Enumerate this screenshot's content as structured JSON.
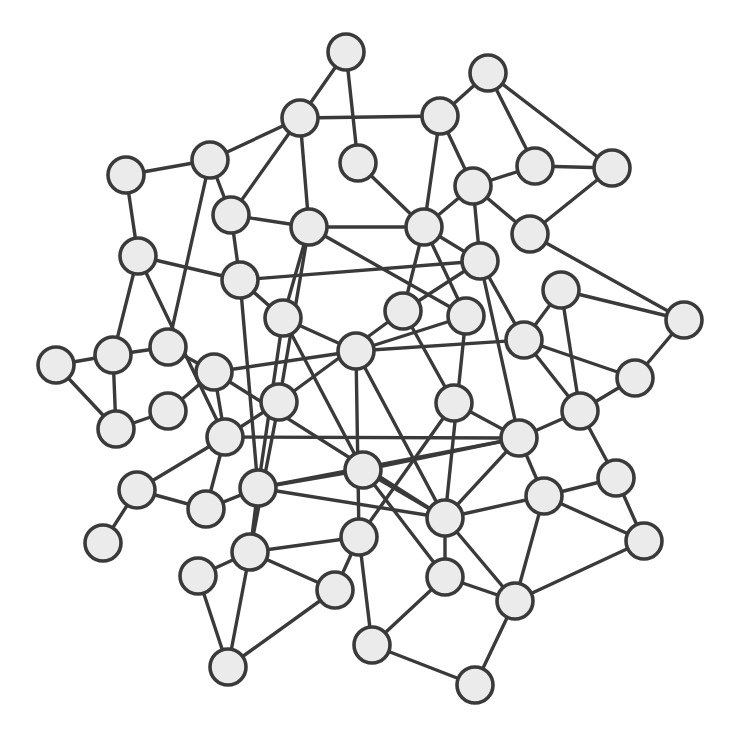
{
  "diagram": {
    "type": "network-graph",
    "style": {
      "background": "#ffffff",
      "node_fill": "#ebebeb",
      "node_stroke": "#3a3a3a",
      "edge_color": "#3a3a3a",
      "node_radius": 18
    },
    "nodes": [
      {
        "id": 0,
        "x": 346,
        "y": 52
      },
      {
        "id": 1,
        "x": 300,
        "y": 118
      },
      {
        "id": 2,
        "x": 488,
        "y": 73
      },
      {
        "id": 3,
        "x": 440,
        "y": 116
      },
      {
        "id": 4,
        "x": 210,
        "y": 160
      },
      {
        "id": 5,
        "x": 126,
        "y": 175
      },
      {
        "id": 6,
        "x": 358,
        "y": 163
      },
      {
        "id": 7,
        "x": 535,
        "y": 166
      },
      {
        "id": 8,
        "x": 612,
        "y": 168
      },
      {
        "id": 9,
        "x": 473,
        "y": 186
      },
      {
        "id": 10,
        "x": 231,
        "y": 215
      },
      {
        "id": 11,
        "x": 309,
        "y": 227
      },
      {
        "id": 12,
        "x": 424,
        "y": 227
      },
      {
        "id": 13,
        "x": 530,
        "y": 234
      },
      {
        "id": 14,
        "x": 138,
        "y": 256
      },
      {
        "id": 15,
        "x": 240,
        "y": 280
      },
      {
        "id": 16,
        "x": 480,
        "y": 261
      },
      {
        "id": 17,
        "x": 561,
        "y": 290
      },
      {
        "id": 18,
        "x": 283,
        "y": 318
      },
      {
        "id": 19,
        "x": 403,
        "y": 311
      },
      {
        "id": 20,
        "x": 466,
        "y": 316
      },
      {
        "id": 21,
        "x": 684,
        "y": 320
      },
      {
        "id": 22,
        "x": 56,
        "y": 365
      },
      {
        "id": 23,
        "x": 113,
        "y": 355
      },
      {
        "id": 24,
        "x": 168,
        "y": 347
      },
      {
        "id": 25,
        "x": 356,
        "y": 351
      },
      {
        "id": 26,
        "x": 524,
        "y": 340
      },
      {
        "id": 27,
        "x": 214,
        "y": 372
      },
      {
        "id": 28,
        "x": 635,
        "y": 378
      },
      {
        "id": 29,
        "x": 279,
        "y": 402
      },
      {
        "id": 30,
        "x": 454,
        "y": 403
      },
      {
        "id": 31,
        "x": 168,
        "y": 411
      },
      {
        "id": 32,
        "x": 116,
        "y": 429
      },
      {
        "id": 33,
        "x": 580,
        "y": 411
      },
      {
        "id": 34,
        "x": 225,
        "y": 437
      },
      {
        "id": 35,
        "x": 519,
        "y": 438
      },
      {
        "id": 36,
        "x": 363,
        "y": 470
      },
      {
        "id": 37,
        "x": 616,
        "y": 478
      },
      {
        "id": 38,
        "x": 137,
        "y": 490
      },
      {
        "id": 39,
        "x": 258,
        "y": 488
      },
      {
        "id": 40,
        "x": 206,
        "y": 509
      },
      {
        "id": 41,
        "x": 544,
        "y": 496
      },
      {
        "id": 42,
        "x": 445,
        "y": 518
      },
      {
        "id": 43,
        "x": 103,
        "y": 543
      },
      {
        "id": 44,
        "x": 359,
        "y": 537
      },
      {
        "id": 45,
        "x": 644,
        "y": 541
      },
      {
        "id": 46,
        "x": 250,
        "y": 552
      },
      {
        "id": 47,
        "x": 198,
        "y": 576
      },
      {
        "id": 48,
        "x": 445,
        "y": 577
      },
      {
        "id": 49,
        "x": 335,
        "y": 590
      },
      {
        "id": 50,
        "x": 515,
        "y": 601
      },
      {
        "id": 51,
        "x": 372,
        "y": 645
      },
      {
        "id": 52,
        "x": 228,
        "y": 667
      },
      {
        "id": 53,
        "x": 475,
        "y": 685
      }
    ],
    "edges": [
      [
        0,
        1
      ],
      [
        0,
        6
      ],
      [
        1,
        3
      ],
      [
        1,
        4
      ],
      [
        1,
        10
      ],
      [
        1,
        11
      ],
      [
        2,
        3
      ],
      [
        2,
        7
      ],
      [
        2,
        8
      ],
      [
        3,
        9
      ],
      [
        3,
        12
      ],
      [
        4,
        5
      ],
      [
        4,
        10
      ],
      [
        4,
        24
      ],
      [
        5,
        14
      ],
      [
        6,
        12
      ],
      [
        7,
        9
      ],
      [
        7,
        8
      ],
      [
        8,
        13
      ],
      [
        9,
        12
      ],
      [
        9,
        16
      ],
      [
        9,
        13
      ],
      [
        10,
        11
      ],
      [
        10,
        15
      ],
      [
        11,
        12
      ],
      [
        11,
        18
      ],
      [
        11,
        29
      ],
      [
        11,
        20
      ],
      [
        12,
        16
      ],
      [
        12,
        19
      ],
      [
        12,
        20
      ],
      [
        13,
        21
      ],
      [
        14,
        15
      ],
      [
        14,
        23
      ],
      [
        14,
        34
      ],
      [
        15,
        16
      ],
      [
        15,
        18
      ],
      [
        15,
        39
      ],
      [
        16,
        26
      ],
      [
        16,
        19
      ],
      [
        16,
        35
      ],
      [
        17,
        21
      ],
      [
        17,
        26
      ],
      [
        17,
        33
      ],
      [
        18,
        25
      ],
      [
        18,
        36
      ],
      [
        18,
        39
      ],
      [
        19,
        29
      ],
      [
        19,
        30
      ],
      [
        20,
        25
      ],
      [
        20,
        42
      ],
      [
        21,
        28
      ],
      [
        22,
        23
      ],
      [
        22,
        32
      ],
      [
        23,
        24
      ],
      [
        23,
        32
      ],
      [
        24,
        27
      ],
      [
        25,
        26
      ],
      [
        25,
        44
      ],
      [
        25,
        42
      ],
      [
        25,
        27
      ],
      [
        26,
        33
      ],
      [
        26,
        28
      ],
      [
        27,
        31
      ],
      [
        27,
        34
      ],
      [
        27,
        42
      ],
      [
        28,
        33
      ],
      [
        29,
        34
      ],
      [
        29,
        46
      ],
      [
        30,
        35
      ],
      [
        30,
        44
      ],
      [
        31,
        32
      ],
      [
        33,
        35
      ],
      [
        33,
        37
      ],
      [
        34,
        38
      ],
      [
        34,
        40
      ],
      [
        34,
        35
      ],
      [
        35,
        36
      ],
      [
        35,
        39
      ],
      [
        35,
        41
      ],
      [
        35,
        42
      ],
      [
        36,
        39
      ],
      [
        36,
        42
      ],
      [
        36,
        48
      ],
      [
        37,
        41
      ],
      [
        37,
        45
      ],
      [
        38,
        40
      ],
      [
        38,
        43
      ],
      [
        39,
        40
      ],
      [
        39,
        46
      ],
      [
        39,
        42
      ],
      [
        41,
        42
      ],
      [
        41,
        50
      ],
      [
        41,
        45
      ],
      [
        42,
        48
      ],
      [
        42,
        50
      ],
      [
        44,
        46
      ],
      [
        44,
        49
      ],
      [
        44,
        51
      ],
      [
        45,
        50
      ],
      [
        46,
        47
      ],
      [
        46,
        52
      ],
      [
        46,
        49
      ],
      [
        47,
        52
      ],
      [
        48,
        50
      ],
      [
        48,
        51
      ],
      [
        49,
        52
      ],
      [
        50,
        53
      ],
      [
        51,
        53
      ]
    ]
  }
}
